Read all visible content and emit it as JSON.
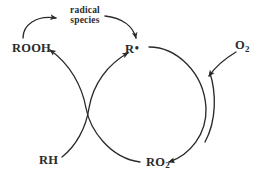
{
  "diagram": {
    "type": "reaction-cycle",
    "background_color": "#ffffff",
    "stroke_color": "#2b2b2b",
    "text_color": "#2b2b2b",
    "species": {
      "hydroperoxide": "ROOH",
      "carbon_radical_prefix": "R",
      "carbon_radical_dot": "•",
      "oxygen": "O",
      "oxygen_subscript": "2",
      "peroxyl_prefix": "RO",
      "peroxyl_subscript": "2",
      "peroxyl_dot": "•",
      "substrate": "RH"
    },
    "annotation": {
      "line1": "radical",
      "line2": "species"
    },
    "arrows": [
      {
        "name": "rooh-to-radical-species",
        "from": "ROOH",
        "to": "radical species",
        "direction": "up-right"
      },
      {
        "name": "radical-species-to-r-radical",
        "from": "radical species",
        "to": "R•",
        "direction": "down-right"
      },
      {
        "name": "ro2-to-rooh",
        "from": "RO2•",
        "to": "ROOH",
        "direction": "up-left"
      },
      {
        "name": "rh-to-r-radical",
        "from": "RH",
        "to": "R•",
        "direction": "up-right"
      },
      {
        "name": "r-radical-to-ro2",
        "from": "R•",
        "to": "RO2•",
        "direction": "clockwise"
      },
      {
        "name": "o2-into-cycle",
        "from": "O2",
        "to": "R• + O2 junction",
        "direction": "down-left"
      },
      {
        "name": "o2-to-ro2",
        "from": "O2 branch",
        "to": "RO2•",
        "direction": "down-left"
      }
    ]
  }
}
